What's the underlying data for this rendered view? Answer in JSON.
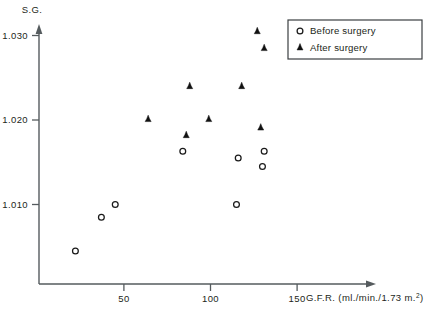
{
  "chart_data": {
    "type": "scatter",
    "title": "",
    "xlabel": "G.F.R. (ml./min./1.73 m.²)",
    "xlabel_main": "G.F.R. (ml./min./1.73 m.",
    "xlabel_sup": "2",
    "xlabel_tail": ")",
    "ylabel": "S.G.",
    "xlim": [
      0,
      160
    ],
    "ylim": [
      1.0035,
      1.0325
    ],
    "xticks": [
      50,
      100,
      150
    ],
    "xticklabels": [
      "50",
      "100",
      "150"
    ],
    "yticks": [
      1.01,
      1.02,
      1.03
    ],
    "yticklabels": [
      "1.010",
      "1.020",
      "1.030"
    ],
    "grid": false,
    "legend_position": "top-right",
    "series": [
      {
        "name": "Before surgery",
        "marker": "open-circle",
        "color": "#1a1a1a",
        "points": [
          {
            "x": 22,
            "y": 1.0045
          },
          {
            "x": 37,
            "y": 1.0085
          },
          {
            "x": 45,
            "y": 1.01
          },
          {
            "x": 84,
            "y": 1.0163
          },
          {
            "x": 115,
            "y": 1.01
          },
          {
            "x": 116,
            "y": 1.0155
          },
          {
            "x": 130,
            "y": 1.0145
          },
          {
            "x": 131,
            "y": 1.0163
          }
        ]
      },
      {
        "name": "After surgery",
        "marker": "filled-triangle",
        "color": "#111111",
        "points": [
          {
            "x": 64,
            "y": 1.0201
          },
          {
            "x": 88,
            "y": 1.024
          },
          {
            "x": 86,
            "y": 1.0182
          },
          {
            "x": 99,
            "y": 1.0201
          },
          {
            "x": 118,
            "y": 1.024
          },
          {
            "x": 127,
            "y": 1.0305
          },
          {
            "x": 131,
            "y": 1.0285
          },
          {
            "x": 129,
            "y": 1.0191
          }
        ]
      }
    ]
  },
  "legend": {
    "entries": [
      {
        "label": "Before surgery",
        "marker": "open-circle"
      },
      {
        "label": "After surgery",
        "marker": "filled-triangle"
      }
    ]
  }
}
